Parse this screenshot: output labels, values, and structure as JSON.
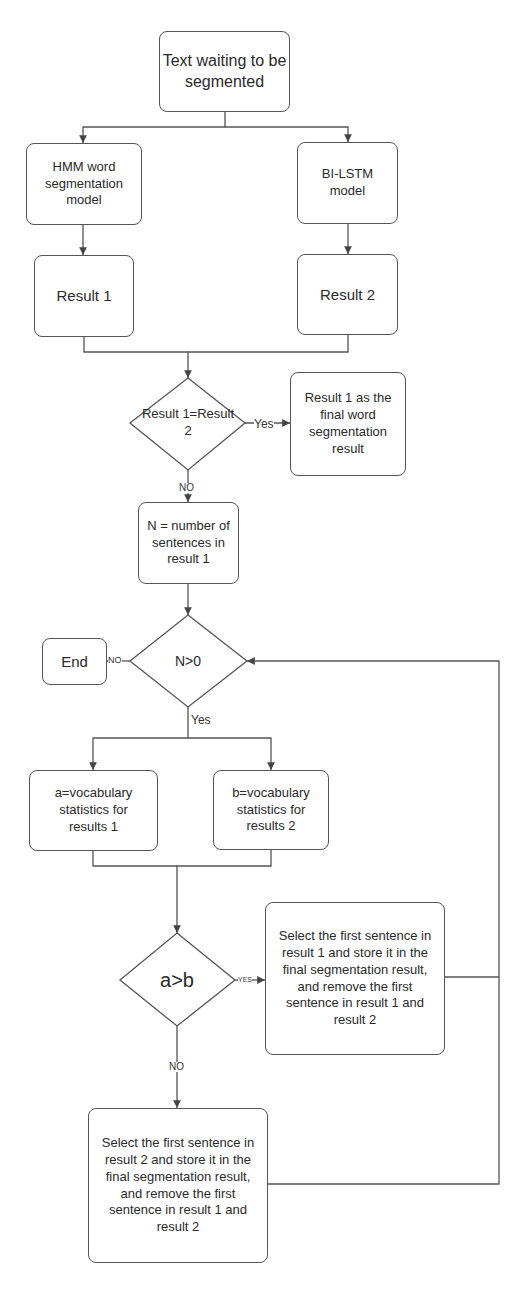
{
  "nodes": {
    "start": "Text waiting to be segmented",
    "hmm": "HMM word segmentation model",
    "bilstm": "BI-LSTM model",
    "result1": "Result 1",
    "result2": "Result 2",
    "decision_equal": "Result 1=Result 2",
    "final_result1": "Result 1 as the final word segmentation result",
    "count_n": "N = number of sentences in result 1",
    "decision_n": "N>0",
    "end": "End",
    "vocab_a": "a=vocabulary statistics for results 1",
    "vocab_b": "b=vocabulary statistics for results 2",
    "decision_ab": "a>b",
    "select_result1": "Select the first sentence in result 1 and store it in the final segmentation result, and remove the first sentence in result 1 and result 2",
    "select_result2": "Select the first sentence in result 2 and store it in the final segmentation result, and remove the first sentence in result 1 and result 2"
  },
  "edge_labels": {
    "equal_yes": "Yes",
    "equal_no": "NO",
    "n_no": "NO",
    "n_yes": "Yes",
    "ab_yes": "YES",
    "ab_no": "NO"
  },
  "colors": {
    "stroke": "#555555",
    "text": "#2a2a2a",
    "background": "#ffffff"
  }
}
